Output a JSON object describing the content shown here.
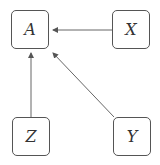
{
  "nodes": [
    {
      "id": "A",
      "label": "A"
    },
    {
      "id": "X",
      "label": "X"
    },
    {
      "id": "Z",
      "label": "Z"
    },
    {
      "id": "Y",
      "label": "Y"
    }
  ],
  "edges": [
    {
      "from": "X",
      "to": "A"
    },
    {
      "from": "Z",
      "to": "A"
    },
    {
      "from": "Y",
      "to": "A"
    }
  ]
}
